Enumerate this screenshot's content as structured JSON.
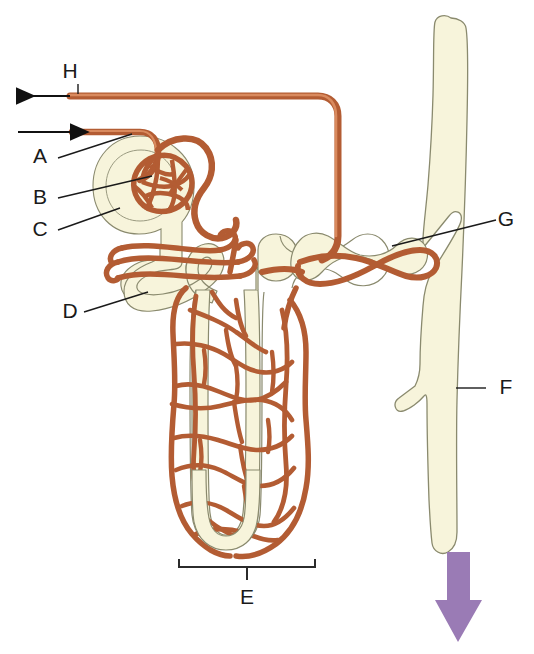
{
  "figure": {
    "background_color": "#ffffff",
    "vessel_color": "#c1663b",
    "vessel_fill": "#d98a5e",
    "tubule_fill": "#f7f4db",
    "tubule_stroke": "#8a8a6e",
    "label_color": "#1a1a1a",
    "arrow_color": "#9a7bb5"
  },
  "labels": [
    {
      "id": "H",
      "text": "H",
      "x": 78,
      "y": 78,
      "name": "label-h-efferent-venule"
    },
    {
      "id": "A",
      "text": "A",
      "x": 40,
      "y": 163,
      "name": "label-a-afferent-arteriole"
    },
    {
      "id": "B",
      "text": "B",
      "x": 40,
      "y": 204,
      "name": "label-b-glomerulus"
    },
    {
      "id": "C",
      "text": "C",
      "x": 40,
      "y": 236,
      "name": "label-c-bowmans-capsule"
    },
    {
      "id": "D",
      "text": "D",
      "x": 66,
      "y": 318,
      "name": "label-d-proximal-tubule"
    },
    {
      "id": "E",
      "text": "E",
      "x": 241,
      "y": 604,
      "name": "label-e-loop-of-henle"
    },
    {
      "id": "F",
      "text": "F",
      "x": 503,
      "y": 394,
      "name": "label-f-collecting-duct"
    },
    {
      "id": "G",
      "text": "G",
      "x": 503,
      "y": 226,
      "name": "label-g-distal-tubule"
    }
  ],
  "flow_arrows": [
    {
      "id": "outflow",
      "direction": "left",
      "name": "blood-outflow-arrow",
      "x1": 70,
      "y1": 96,
      "x2": 14,
      "y2": 96
    },
    {
      "id": "inflow",
      "direction": "right",
      "name": "blood-inflow-arrow",
      "x1": 18,
      "y1": 132,
      "x2": 72,
      "y2": 132
    },
    {
      "id": "urine",
      "direction": "down",
      "name": "urine-flow-arrow",
      "color": "#9a7bb5",
      "x": 457,
      "y_top": 552,
      "y_bottom": 640
    }
  ],
  "bracket": {
    "name": "loop-of-henle-bracket",
    "x_left": 178,
    "x_right": 316,
    "y": 566,
    "tick_y": 580
  },
  "parts": [
    {
      "key": "A",
      "name": "afferent-arteriole"
    },
    {
      "key": "B",
      "name": "glomerulus"
    },
    {
      "key": "C",
      "name": "bowmans-capsule"
    },
    {
      "key": "D",
      "name": "proximal-convoluted-tubule"
    },
    {
      "key": "E",
      "name": "loop-of-henle"
    },
    {
      "key": "F",
      "name": "collecting-duct"
    },
    {
      "key": "G",
      "name": "distal-convoluted-tubule"
    },
    {
      "key": "H",
      "name": "efferent-venule"
    }
  ]
}
